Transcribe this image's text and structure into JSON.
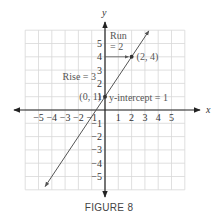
{
  "chart_data": {
    "type": "line",
    "title": "",
    "caption": "FIGURE 8",
    "xlabel": "x",
    "ylabel": "y",
    "xlim": [
      -6,
      6
    ],
    "ylim": [
      -6,
      6
    ],
    "grid": true,
    "x_ticks": [
      -5,
      -4,
      -3,
      -2,
      -1,
      1,
      2,
      3,
      4,
      5
    ],
    "y_ticks": [
      -5,
      -4,
      -3,
      -2,
      -1,
      1,
      2,
      3,
      4,
      5
    ],
    "x_tick_labels": [
      "−5",
      "−4",
      "−3",
      "−2",
      "−1",
      "1",
      "2",
      "3",
      "4",
      "5"
    ],
    "y_tick_labels": [
      "−5",
      "−4",
      "−3",
      "−2",
      "−1",
      "1",
      "2",
      "3",
      "4",
      "5"
    ],
    "series": [
      {
        "name": "y = 1.5x + 1",
        "slope": 1.5,
        "intercept": 1,
        "x_range": [
          -4.5,
          3.3
        ]
      }
    ],
    "points": [
      {
        "x": 0,
        "y": 1,
        "label": "(0, 1)"
      },
      {
        "x": 2,
        "y": 4,
        "label": "(2, 4)"
      }
    ],
    "annotations": {
      "rise": "Rise = 3",
      "run_line1": "Run",
      "run_line2": "= 2",
      "intercept": "y-intercept = 1"
    }
  }
}
